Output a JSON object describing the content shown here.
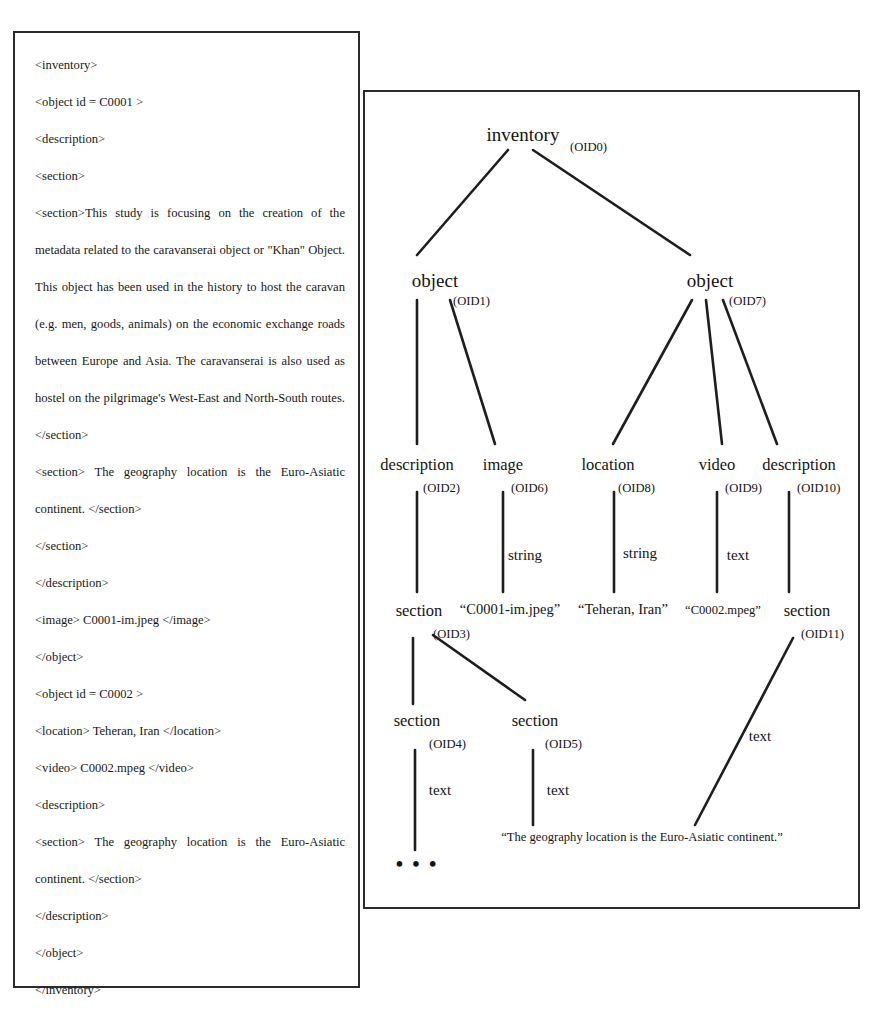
{
  "figure": {
    "left_panel": {
      "name": "xml-document",
      "lines": [
        {
          "text": "<inventory>",
          "justified": false
        },
        {
          "text": "<object id = C0001 >",
          "justified": false
        },
        {
          "text": "<description>",
          "justified": false
        },
        {
          "text": "<section>",
          "justified": false
        },
        {
          "text": "<section>This study is focusing on the creation of the metadata related to the caravanserai object or \"Khan\" Object. This object has been used in the history to host the caravan (e.g. men, goods, animals) on the economic exchange roads between Europe and Asia. The caravanserai is also used as hostel on the pilgrimage's West-East and North-South routes.</section>",
          "justified": true
        },
        {
          "text": "<section> The geography location is the Euro-Asiatic continent. </section>",
          "justified": true
        },
        {
          "text": "</section>",
          "justified": false
        },
        {
          "text": "</description>",
          "justified": false
        },
        {
          "text": "<image> C0001-im.jpeg </image>",
          "justified": false
        },
        {
          "text": "</object>",
          "justified": false
        },
        {
          "text": "<object id = C0002 >",
          "justified": false
        },
        {
          "text": "<location> Teheran, Iran </location>",
          "justified": false
        },
        {
          "text": "<video> C0002.mpeg </video>",
          "justified": false
        },
        {
          "text": "<description>",
          "justified": false
        },
        {
          "text": "<section> The geography location is the Euro-Asiatic continent. </section>",
          "justified": true
        },
        {
          "text": "</description>",
          "justified": false
        },
        {
          "text": "</object>",
          "justified": false
        },
        {
          "text": "</inventory>",
          "justified": false
        }
      ]
    },
    "right_panel": {
      "name": "oem-object-tree",
      "nodes": [
        {
          "id": "n-inventory",
          "label": "inventory",
          "oid": "(OID0)",
          "x": 158,
          "y": 44,
          "oid_x": 205,
          "oid_y": 58,
          "size": "big"
        },
        {
          "id": "n-object-1",
          "label": "object",
          "oid": "(OID1)",
          "x": 70,
          "y": 190,
          "oid_x": 88,
          "oid_y": 212,
          "size": "big"
        },
        {
          "id": "n-object-2",
          "label": "object",
          "oid": "(OID7)",
          "x": 345,
          "y": 190,
          "oid_x": 364,
          "oid_y": 212,
          "size": "big"
        },
        {
          "id": "n-description-1",
          "label": "description",
          "oid": "(OID2)",
          "x": 52,
          "y": 374,
          "oid_x": 58,
          "oid_y": 397,
          "size": "normal"
        },
        {
          "id": "n-image",
          "label": "image",
          "oid": "(OID6)",
          "x": 138,
          "y": 374,
          "oid_x": 146,
          "oid_y": 397,
          "size": "normal"
        },
        {
          "id": "n-location",
          "label": "location",
          "oid": "(OID8)",
          "x": 243,
          "y": 374,
          "oid_x": 253,
          "oid_y": 397,
          "size": "normal"
        },
        {
          "id": "n-video",
          "label": "video",
          "oid": "(OID9)",
          "x": 352,
          "y": 374,
          "oid_x": 360,
          "oid_y": 397,
          "size": "normal"
        },
        {
          "id": "n-description-2",
          "label": "description",
          "oid": "(OID10)",
          "x": 434,
          "y": 374,
          "oid_x": 434,
          "oid_y": 397,
          "size": "normal"
        },
        {
          "id": "n-section-oid3",
          "label": "section",
          "oid": "(OID3)",
          "x": 54,
          "y": 520,
          "oid_x": 68,
          "oid_y": 543,
          "size": "normal"
        },
        {
          "id": "n-section-oid11",
          "label": "section",
          "oid": "(OID11)",
          "x": 442,
          "y": 520,
          "oid_x": 440,
          "oid_y": 543,
          "size": "normal"
        },
        {
          "id": "n-section-oid4",
          "label": "section",
          "oid": "(OID4)",
          "x": 52,
          "y": 630,
          "oid_x": 64,
          "oid_y": 653,
          "size": "normal"
        },
        {
          "id": "n-section-oid5",
          "label": "section",
          "oid": "(OID5)",
          "x": 170,
          "y": 630,
          "oid_x": 180,
          "oid_y": 653,
          "size": "normal"
        }
      ],
      "edge_labels": [
        {
          "id": "e-string-image",
          "text": "string",
          "x": 138,
          "y": 470
        },
        {
          "id": "e-string-location",
          "text": "string",
          "x": 252,
          "y": 468
        },
        {
          "id": "e-text-video",
          "text": "text",
          "x": 352,
          "y": 470
        },
        {
          "id": "e-text-oid11",
          "text": "text",
          "x": 395,
          "y": 646
        },
        {
          "id": "e-text-oid4",
          "text": "text",
          "x": 55,
          "y": 700
        },
        {
          "id": "e-text-oid5",
          "text": "text",
          "x": 170,
          "y": 700
        }
      ],
      "leaf_values": [
        {
          "id": "v-image",
          "text": "“C0001-im.jpeg”",
          "x": 145,
          "y": 520,
          "size": "normal"
        },
        {
          "id": "v-location",
          "text": "“Teheran, Iran”",
          "x": 258,
          "y": 520,
          "size": "normal"
        },
        {
          "id": "v-video",
          "text": "“C0002.mpeg”",
          "x": 358,
          "y": 520,
          "size": "small"
        },
        {
          "id": "v-geography",
          "text": "“The geography location is the Euro-Asiatic continent.”",
          "x": 277,
          "y": 748,
          "size": "small"
        }
      ],
      "ellipsis": {
        "id": "tree-ellipsis",
        "text": "• • •",
        "x": 52,
        "y": 768
      }
    }
  },
  "colors": {
    "ink": "#141414",
    "border": "#2b2b2b",
    "background": "#ffffff"
  }
}
